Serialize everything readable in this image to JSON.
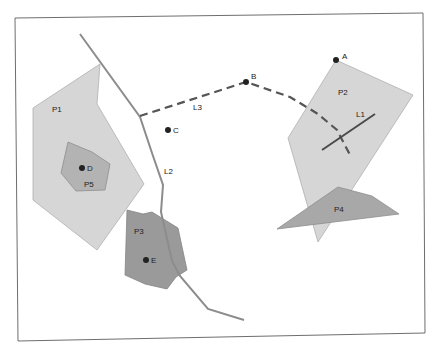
{
  "diagram": {
    "type": "spatial-features-map",
    "colors": {
      "frame": "#6e6e6e",
      "polygon_light": "#d6d6d6",
      "polygon_medium": "#b3b3b3",
      "polygon_dark": "#9a9a9a",
      "line_light": "#8c8c8c",
      "line_dark": "#4a4a4a",
      "point": "#222222"
    },
    "polygons": [
      {
        "id": "P1",
        "label": "P1"
      },
      {
        "id": "P2",
        "label": "P2"
      },
      {
        "id": "P3",
        "label": "P3"
      },
      {
        "id": "P4",
        "label": "P4"
      },
      {
        "id": "P5",
        "label": "P5"
      }
    ],
    "lines": [
      {
        "id": "L1",
        "label": "L1",
        "style": "solid"
      },
      {
        "id": "L2",
        "label": "L2",
        "style": "solid"
      },
      {
        "id": "L3",
        "label": "L3",
        "style": "dashed"
      }
    ],
    "points": [
      {
        "id": "A",
        "label": "A"
      },
      {
        "id": "B",
        "label": "B"
      },
      {
        "id": "C",
        "label": "C"
      },
      {
        "id": "D",
        "label": "D"
      },
      {
        "id": "E",
        "label": "E"
      }
    ]
  }
}
